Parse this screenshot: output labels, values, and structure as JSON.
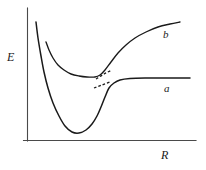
{
  "figure": {
    "kind": "potential-energy-curve-diagram",
    "background_color": "#ffffff",
    "axis_color": "#4a4a4a",
    "curve_color": "#1a1a1a",
    "axes": {
      "y_label": "E",
      "x_label": "R"
    },
    "curve_labels": {
      "upper": "b",
      "lower": "a"
    }
  },
  "chart_data": {
    "type": "line",
    "title": "",
    "xlabel": "R",
    "ylabel": "E",
    "grid": false,
    "legend": "inline-curve-labels",
    "axis_ranges": {
      "x_axis_pixel_span": [
        27,
        196
      ],
      "y_axis_pixel_span": [
        8,
        140
      ],
      "x_units": "internuclear distance (arbitrary units)",
      "y_units": "energy (arbitrary units)"
    },
    "annotations": [
      {
        "text": "b",
        "x_px": 166,
        "y_px": 34,
        "note": "label for upper/repulsive-to-rising curve"
      },
      {
        "text": "a",
        "x_px": 167,
        "y_px": 88,
        "note": "label for lower bonding curve asymptote"
      },
      {
        "text": "E",
        "x_px": 10,
        "y_px": 56,
        "note": "vertical axis label"
      },
      {
        "text": "R",
        "x_px": 164,
        "y_px": 154,
        "note": "horizontal axis label"
      }
    ],
    "series": [
      {
        "name": "a",
        "label": "a",
        "style": "solid",
        "description": "Attractive (Morse-like) potential: steep repulsive wall at small R, deep minimum near R=72px/E=133px, rising to a flat horizontal asymptote at E=78px toward large R.",
        "points_px": [
          [
            36,
            22
          ],
          [
            38,
            38
          ],
          [
            41,
            56
          ],
          [
            44,
            72
          ],
          [
            48,
            88
          ],
          [
            53,
            103
          ],
          [
            59,
            116
          ],
          [
            65,
            126
          ],
          [
            72,
            132
          ],
          [
            79,
            133
          ],
          [
            86,
            130
          ],
          [
            92,
            124
          ],
          [
            97,
            116
          ],
          [
            101,
            107
          ],
          [
            105,
            97
          ],
          [
            109,
            88
          ],
          [
            114,
            83
          ],
          [
            120,
            80
          ],
          [
            130,
            78.5
          ],
          [
            145,
            78
          ],
          [
            165,
            78
          ],
          [
            190,
            78
          ]
        ]
      },
      {
        "name": "b",
        "label": "b",
        "style": "solid",
        "description": "Second diabatic curve: descends from upper left, flattens through a shallow region, then rises steeply through the crossing toward the upper right.",
        "points_px": [
          [
            46,
            42
          ],
          [
            49,
            50
          ],
          [
            53,
            58
          ],
          [
            58,
            65
          ],
          [
            64,
            70
          ],
          [
            71,
            74
          ],
          [
            79,
            76
          ],
          [
            87,
            77
          ],
          [
            95,
            77
          ],
          [
            100,
            75
          ],
          [
            105,
            70
          ],
          [
            111,
            62
          ],
          [
            118,
            53
          ],
          [
            126,
            45
          ],
          [
            135,
            38
          ],
          [
            146,
            32
          ],
          [
            158,
            27
          ],
          [
            170,
            24
          ],
          [
            180,
            22
          ]
        ]
      }
    ],
    "dashed_segments": [
      {
        "name": "upper-diabatic-continuation",
        "style": "dashed",
        "description": "Short dashed stub above-right of the crossing point",
        "points_px": [
          [
            96,
            79
          ],
          [
            104,
            74
          ],
          [
            112,
            70
          ]
        ]
      },
      {
        "name": "lower-diabatic-continuation",
        "style": "dashed",
        "description": "Short dashed stub below-left of the crossing point",
        "points_px": [
          [
            94,
            88
          ],
          [
            102,
            85
          ],
          [
            110,
            82
          ]
        ]
      }
    ],
    "crossing_point_px": [
      103,
      79
    ]
  }
}
